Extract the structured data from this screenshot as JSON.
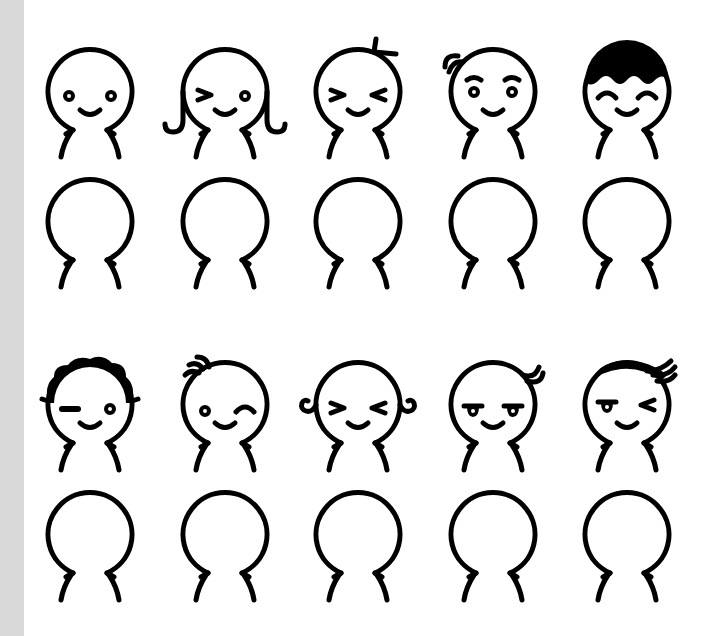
{
  "page": {
    "background": "#ffffff",
    "sidebar_color": "#d9d9d9",
    "stroke_color": "#000000"
  },
  "grid": {
    "columns": [
      90,
      225,
      358,
      493,
      627
    ],
    "rows": [
      {
        "head_cy": 92,
        "kind": "faces"
      },
      {
        "head_cy": 222,
        "kind": "blank"
      },
      {
        "head_cy": 405,
        "kind": "faces"
      },
      {
        "head_cy": 535,
        "kind": "blank"
      }
    ],
    "head_radius": 42
  },
  "characters": [
    {
      "row": 0,
      "col": 0,
      "name": "plain-dot-eyes",
      "hair": "none",
      "left_eye": "dot",
      "right_eye": "dot",
      "mouth": "smile"
    },
    {
      "row": 0,
      "col": 1,
      "name": "curly-sides-wink",
      "hair": "side-curls-down",
      "left_eye": "arrow-right",
      "right_eye": "dot",
      "mouth": "smile"
    },
    {
      "row": 0,
      "col": 2,
      "name": "sprout-squint",
      "hair": "sprout",
      "left_eye": "arrow-right",
      "right_eye": "arrow-left",
      "mouth": "smile"
    },
    {
      "row": 0,
      "col": 3,
      "name": "curl-brows",
      "hair": "top-left-curl",
      "left_eye": "dot-with-brow",
      "right_eye": "dot-with-brow",
      "mouth": "smile"
    },
    {
      "row": 0,
      "col": 4,
      "name": "bowl-cut-happy",
      "hair": "bowl-cut",
      "left_eye": "arc-closed",
      "right_eye": "arc-closed",
      "mouth": "smile"
    },
    {
      "row": 2,
      "col": 0,
      "name": "wavy-hair-wink",
      "hair": "wavy-top",
      "left_eye": "dash",
      "right_eye": "dot",
      "mouth": "smile"
    },
    {
      "row": 2,
      "col": 1,
      "name": "tuft-wink",
      "hair": "tuft-left",
      "left_eye": "dot",
      "right_eye": "arc-closed",
      "mouth": "smile"
    },
    {
      "row": 2,
      "col": 2,
      "name": "side-curls-squint",
      "hair": "side-curls-out",
      "left_eye": "arrow-right",
      "right_eye": "arrow-left",
      "mouth": "smile"
    },
    {
      "row": 2,
      "col": 3,
      "name": "right-curl-sly",
      "hair": "top-right-curl",
      "left_eye": "half-lid",
      "right_eye": "half-lid",
      "mouth": "smile"
    },
    {
      "row": 2,
      "col": 4,
      "name": "swoop-hair-wink",
      "hair": "swoop-right",
      "left_eye": "half-lid",
      "right_eye": "arrow-left",
      "mouth": "smile"
    }
  ]
}
